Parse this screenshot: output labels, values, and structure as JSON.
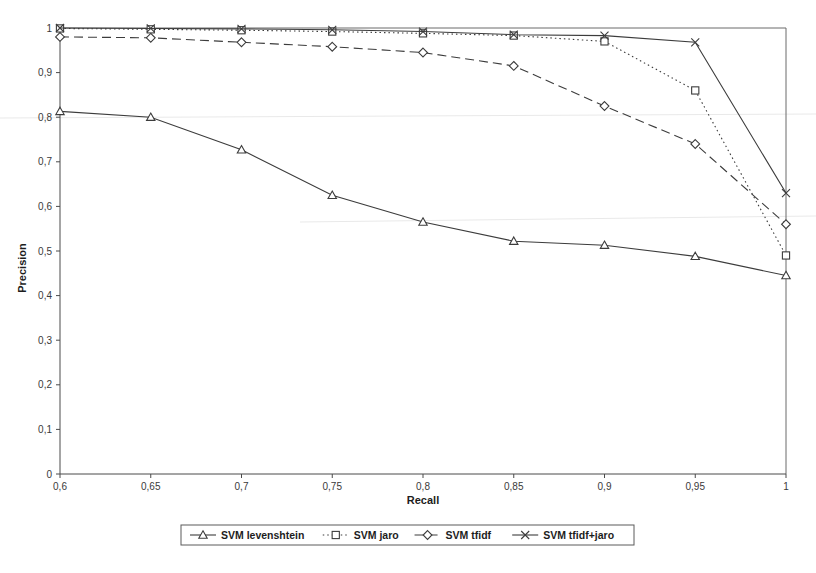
{
  "chart_data": {
    "type": "line",
    "title": "",
    "xlabel": "Recall",
    "ylabel": "Precision",
    "xlim": [
      0.6,
      1.0
    ],
    "ylim": [
      0,
      1
    ],
    "grid": false,
    "legend_position": "bottom",
    "x": [
      0.6,
      0.65,
      0.7,
      0.75,
      0.8,
      0.85,
      0.9,
      0.95,
      1.0
    ],
    "x_tick_labels": [
      "0,6",
      "0,65",
      "0,7",
      "0,75",
      "0,8",
      "0,85",
      "0,9",
      "0,95",
      "1"
    ],
    "y_ticks": [
      0,
      0.1,
      0.2,
      0.3,
      0.4,
      0.5,
      0.6,
      0.7,
      0.8,
      0.9,
      1.0
    ],
    "y_tick_labels": [
      "0",
      "0,1",
      "0,2",
      "0,3",
      "0,4",
      "0,5",
      "0,6",
      "0,7",
      "0,8",
      "0,9",
      "1"
    ],
    "series": [
      {
        "name": "SVM levenshtein",
        "marker": "triangle",
        "dash": "none",
        "values": [
          0.813,
          0.8,
          0.727,
          0.625,
          0.565,
          0.522,
          0.513,
          0.488,
          0.445
        ]
      },
      {
        "name": "SVM jaro",
        "marker": "square",
        "dash": "dotted",
        "values": [
          0.999,
          0.997,
          0.995,
          0.992,
          0.988,
          0.983,
          0.97,
          0.86,
          0.49
        ]
      },
      {
        "name": "SVM tfidf",
        "marker": "diamond",
        "dash": "dashed",
        "values": [
          0.98,
          0.978,
          0.968,
          0.958,
          0.945,
          0.915,
          0.825,
          0.74,
          0.56
        ]
      },
      {
        "name": "SVM tfidf+jaro",
        "marker": "cross",
        "dash": "none",
        "values": [
          1.0,
          0.999,
          0.998,
          0.996,
          0.992,
          0.985,
          0.983,
          0.968,
          0.63
        ]
      }
    ]
  },
  "axes": {
    "x_title": "Recall",
    "y_title": "Precision"
  },
  "legend": {
    "entries": [
      {
        "label": "SVM levenshtein"
      },
      {
        "label": "SVM jaro"
      },
      {
        "label": "SVM tfidf"
      },
      {
        "label": "SVM tfidf+jaro"
      }
    ]
  }
}
